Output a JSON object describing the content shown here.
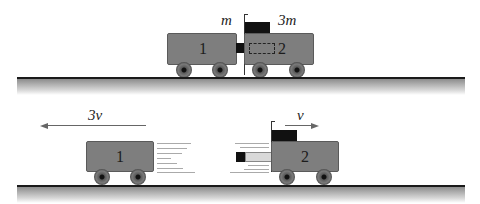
{
  "top_scene": {
    "cart1": {
      "number": "1",
      "mass_label": "m"
    },
    "cart2": {
      "number": "2",
      "mass_label": "3m"
    }
  },
  "bottom_scene": {
    "cart1": {
      "number": "1",
      "velocity_label": "3v",
      "direction": "left"
    },
    "cart2": {
      "number": "2",
      "velocity_label": "v",
      "direction": "right"
    }
  },
  "colors": {
    "cart_body": "#7e7e7e",
    "spring_block": "#111111",
    "ground_line": "#1a1a1a"
  }
}
